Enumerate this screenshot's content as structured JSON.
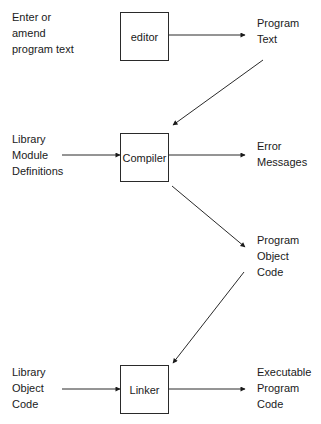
{
  "diagram": {
    "boxes": {
      "editor": "editor",
      "compiler": "Compiler",
      "linker": "Linker"
    },
    "labels": {
      "enter_amend": "Enter or\namend\nprogram text",
      "program_text": "Program\nText",
      "library_module_definitions": "Library\nModule\nDefinitions",
      "error_messages": "Error\nMessages",
      "program_object_code": "Program\nObject\nCode",
      "library_object_code": "Library\nObject\nCode",
      "executable_program_code": "Executable\nProgram\nCode"
    },
    "edges": [
      {
        "from": "editor",
        "to": "Program Text"
      },
      {
        "from": "Program Text",
        "to": "Compiler"
      },
      {
        "from": "Library Module Definitions",
        "to": "Compiler"
      },
      {
        "from": "Compiler",
        "to": "Error Messages"
      },
      {
        "from": "Compiler",
        "to": "Program Object Code"
      },
      {
        "from": "Program Object Code",
        "to": "Linker"
      },
      {
        "from": "Library Object Code",
        "to": "Linker"
      },
      {
        "from": "Linker",
        "to": "Executable Program Code"
      }
    ],
    "line_color": "#2a2a2a"
  }
}
